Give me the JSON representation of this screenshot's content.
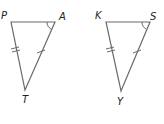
{
  "diagram": {
    "stroke_color": "#6b6b6b",
    "label_color": "#222222",
    "triangles": [
      {
        "id": "PAT",
        "vertices": {
          "P": {
            "label": "P",
            "x": 11,
            "y": 22
          },
          "A": {
            "label": "A",
            "x": 55,
            "y": 22
          },
          "T": {
            "label": "T",
            "x": 25,
            "y": 90
          }
        },
        "tick_marks": {
          "PT": 2,
          "AT": 1
        },
        "angle_mark": "A"
      },
      {
        "id": "KSY",
        "vertices": {
          "K": {
            "label": "K",
            "x": 106,
            "y": 22
          },
          "S": {
            "label": "S",
            "x": 150,
            "y": 22
          },
          "Y": {
            "label": "Y",
            "x": 121,
            "y": 91
          }
        },
        "tick_marks": {
          "KY": 2,
          "SY": 1
        },
        "angle_mark": "S"
      }
    ]
  }
}
